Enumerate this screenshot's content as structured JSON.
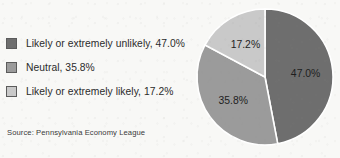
{
  "chart_data": {
    "type": "pie",
    "title": "",
    "subtitle": "",
    "xlabel": "",
    "ylabel": "",
    "legend_position": "left",
    "grid": false,
    "units": "percent",
    "start_angle_deg": 0,
    "direction": "clockwise",
    "categories": [
      "Likely or extremely unlikely",
      "Neutral",
      "Likely or extremely likely"
    ],
    "values": [
      47.0,
      35.8,
      17.2
    ],
    "value_labels": [
      "47.0%",
      "35.8%",
      "17.2%"
    ],
    "colors": [
      "#6e6e6e",
      "#9b9b9b",
      "#c9c9c9"
    ],
    "slices": [
      {
        "name": "Likely or extremely unlikely",
        "value": 47.0,
        "label": "47.0%",
        "legend_text": "Likely or extremely unlikely, 47.0%",
        "color": "#6e6e6e",
        "label_color": "#ffffff"
      },
      {
        "name": "Neutral",
        "value": 35.8,
        "label": "35.8%",
        "legend_text": "Neutral, 35.8%",
        "color": "#9b9b9b",
        "label_color": "#1e1e1e"
      },
      {
        "name": "Likely or extremely likely",
        "value": 17.2,
        "label": "17.2%",
        "legend_text": "Likely or extremely likely, 17.2%",
        "color": "#c9c9c9",
        "label_color": "#1e1e1e"
      }
    ],
    "source": "Source: Pennsylvania Economy League"
  },
  "legend": {
    "items": [
      {
        "label": "Likely or extremely unlikely, 47.0%",
        "color": "#6e6e6e"
      },
      {
        "label": "Neutral, 35.8%",
        "color": "#9b9b9b"
      },
      {
        "label": "Likely or extremely likely, 17.2%",
        "color": "#c9c9c9"
      }
    ]
  },
  "source_note": "Source: Pennsylvania Economy League",
  "palette": {
    "background": "#f8f8f6",
    "slice_outline": "#ffffff",
    "swatch_border": "#5b5b5b",
    "text": "#2b2b2b"
  }
}
